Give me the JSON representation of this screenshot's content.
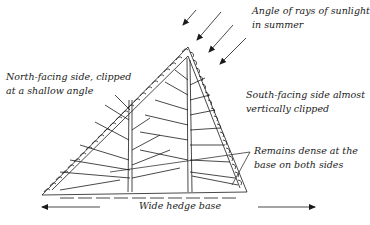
{
  "diagram": {
    "labels": {
      "sunlight": {
        "line1": "Angle of rays of sunlight",
        "line2": "in summer"
      },
      "north_side": {
        "line1": "North-facing side, clipped",
        "line2": "at a shallow angle"
      },
      "south_side": {
        "line1": "South-facing side almost",
        "line2": "vertically clipped"
      },
      "dense_base": {
        "line1": "Remains dense at the",
        "line2": "base on both sides"
      },
      "base": "Wide hedge base"
    },
    "colors": {
      "ink": "#1a1a1a",
      "background": "#ffffff"
    }
  }
}
